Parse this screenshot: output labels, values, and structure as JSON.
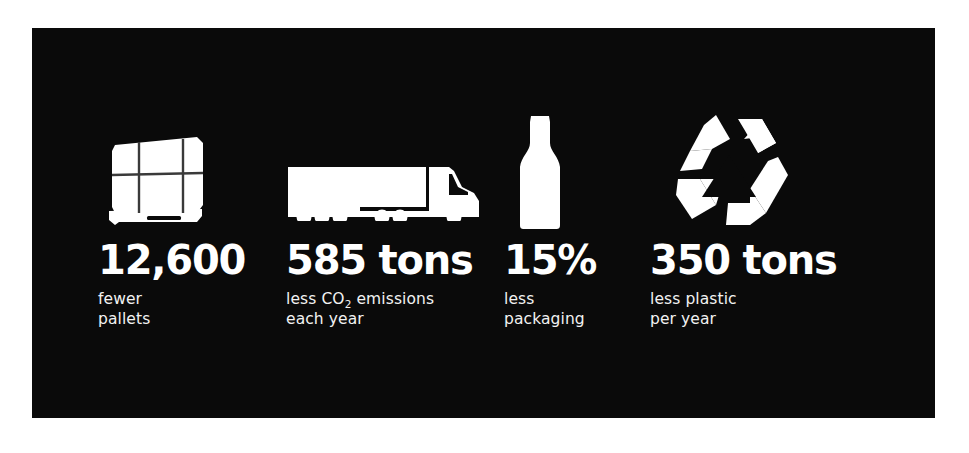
{
  "theme": {
    "page_background": "#ffffff",
    "panel_background": "#0a0a0a",
    "value_color": "#ffffff",
    "caption_color": "#f2f2f2",
    "icon_color": "#ffffff"
  },
  "stats": [
    {
      "icon": "pallet-box-icon",
      "value": "12,600",
      "caption_line_1": "fewer",
      "caption_line_2": "pallets",
      "caption_has_subscript": false
    },
    {
      "icon": "semi-truck-icon",
      "value": "585 tons",
      "caption_line_1_before_sub": "less CO",
      "caption_subscript": "2",
      "caption_line_1_after_sub": " emissions",
      "caption_line_2": "each year",
      "caption_has_subscript": true
    },
    {
      "icon": "bottle-icon",
      "value": "15%",
      "caption_line_1": "less",
      "caption_line_2": "packaging",
      "caption_has_subscript": false
    },
    {
      "icon": "recycle-icon",
      "value": "350 tons",
      "caption_line_1": "less plastic",
      "caption_line_2": "per year",
      "caption_has_subscript": false
    }
  ]
}
